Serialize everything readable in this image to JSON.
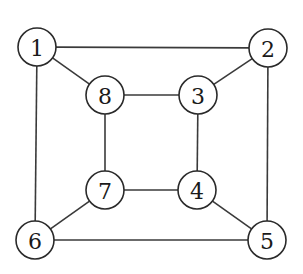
{
  "diagram": {
    "type": "undirected-graph",
    "node_radius": 19,
    "colors": {
      "edge": "#3a3a3a",
      "node_stroke": "#2a2a2a",
      "node_fill": "#ffffff",
      "label": "#1a1a1a",
      "background": "#ffffff"
    },
    "nodes": [
      {
        "id": "1",
        "label": "1",
        "x": 37,
        "y": 47
      },
      {
        "id": "2",
        "label": "2",
        "x": 268,
        "y": 48
      },
      {
        "id": "3",
        "label": "3",
        "x": 198,
        "y": 95
      },
      {
        "id": "4",
        "label": "4",
        "x": 197,
        "y": 190
      },
      {
        "id": "5",
        "label": "5",
        "x": 267,
        "y": 240
      },
      {
        "id": "6",
        "label": "6",
        "x": 35,
        "y": 240
      },
      {
        "id": "7",
        "label": "7",
        "x": 105,
        "y": 190
      },
      {
        "id": "8",
        "label": "8",
        "x": 105,
        "y": 95
      }
    ],
    "edges": [
      {
        "from": "1",
        "to": "2"
      },
      {
        "from": "1",
        "to": "8"
      },
      {
        "from": "1",
        "to": "6"
      },
      {
        "from": "2",
        "to": "3"
      },
      {
        "from": "2",
        "to": "5"
      },
      {
        "from": "8",
        "to": "3"
      },
      {
        "from": "8",
        "to": "7"
      },
      {
        "from": "3",
        "to": "4"
      },
      {
        "from": "7",
        "to": "4"
      },
      {
        "from": "7",
        "to": "6"
      },
      {
        "from": "4",
        "to": "5"
      },
      {
        "from": "6",
        "to": "5"
      }
    ]
  }
}
